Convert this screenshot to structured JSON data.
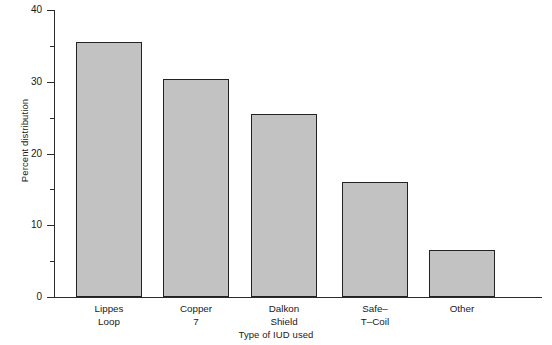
{
  "chart_data": {
    "type": "bar",
    "title": "",
    "xlabel": "Type of IUD used",
    "ylabel": "Percent distribution",
    "categories": [
      "Lippes\nLoop",
      "Copper\n7",
      "Dalkon\nShield",
      "Safe–\nT–Coil",
      "Other"
    ],
    "values": [
      35.5,
      30.4,
      25.5,
      16.0,
      6.5
    ],
    "ylim": [
      0,
      40
    ],
    "yticks_major": [
      0,
      10,
      20,
      30,
      40
    ],
    "yticks_major_labels": [
      "0",
      "10",
      "20",
      "30",
      "40"
    ],
    "yticks_minor": [
      5,
      15,
      25,
      35
    ],
    "grid": false,
    "legend": false,
    "bar_color": "#c2c2c2",
    "bar_edge_color": "#222222",
    "axis_color": "#2b2b2b"
  }
}
